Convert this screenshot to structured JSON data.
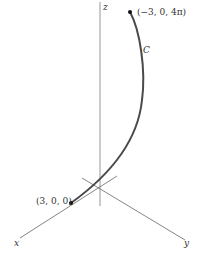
{
  "figure": {
    "axes": {
      "x_label": "x",
      "y_label": "y",
      "z_label": "z"
    },
    "curve": {
      "label": "C",
      "color": "#4a4a4a"
    },
    "points": {
      "start": {
        "label": "(3, 0, 0)"
      },
      "end": {
        "label": "(−3, 0, 4π)"
      }
    },
    "colors": {
      "axis": "#777777",
      "text": "#333333"
    }
  }
}
